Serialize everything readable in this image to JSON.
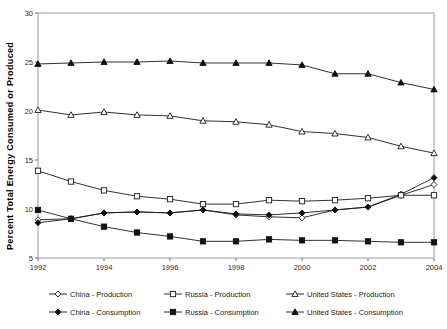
{
  "chart_data": {
    "type": "line",
    "title": "",
    "xlabel": "",
    "ylabel": "Percent Total Energy Consumed or Produced",
    "x": [
      1992,
      1993,
      1994,
      1995,
      1996,
      1997,
      1998,
      1999,
      2000,
      2001,
      2002,
      2003,
      2004
    ],
    "xticks": [
      1992,
      1994,
      1996,
      1998,
      2000,
      2002,
      2004
    ],
    "xtick_labels": [
      "1992",
      "1994",
      "1996",
      "1998",
      "2000",
      "2002",
      "2004"
    ],
    "xlim": [
      1992,
      2004
    ],
    "yticks": [
      5,
      10,
      15,
      20,
      25,
      30
    ],
    "ytick_labels": [
      "5",
      "10",
      "15",
      "20",
      "25",
      "30"
    ],
    "ylim": [
      5,
      30
    ],
    "grid": false,
    "legend_position": "bottom",
    "series": [
      {
        "name": "China - Production",
        "marker": "diamond-open",
        "values": [
          8.9,
          9.0,
          9.6,
          9.7,
          9.6,
          9.9,
          9.4,
          9.2,
          9.1,
          9.9,
          10.2,
          11.4,
          12.5
        ]
      },
      {
        "name": "China - Consumption",
        "marker": "diamond-filled",
        "values": [
          8.6,
          9.0,
          9.6,
          9.7,
          9.6,
          9.9,
          9.5,
          9.4,
          9.6,
          9.9,
          10.2,
          11.5,
          13.2
        ]
      },
      {
        "name": "Russia - Production",
        "marker": "square-open",
        "values": [
          13.9,
          12.8,
          11.9,
          11.3,
          11.0,
          10.5,
          10.5,
          10.9,
          10.8,
          10.9,
          11.1,
          11.4,
          11.4
        ]
      },
      {
        "name": "Russia - Consumption",
        "marker": "square-filled",
        "values": [
          9.9,
          9.0,
          8.2,
          7.6,
          7.2,
          6.7,
          6.7,
          6.9,
          6.8,
          6.8,
          6.7,
          6.6,
          6.6
        ]
      },
      {
        "name": "United States - Production",
        "marker": "triangle-open",
        "values": [
          20.1,
          19.6,
          19.9,
          19.6,
          19.5,
          19.0,
          18.9,
          18.6,
          17.9,
          17.7,
          17.3,
          16.4,
          15.7
        ]
      },
      {
        "name": "United States - Consumption",
        "marker": "triangle-filled",
        "values": [
          24.8,
          24.9,
          25.0,
          25.0,
          25.1,
          24.9,
          24.9,
          24.9,
          24.7,
          23.8,
          23.8,
          22.9,
          22.2
        ]
      }
    ],
    "legend": [
      {
        "label": "China - Production",
        "marker": "diamond-open"
      },
      {
        "label": "Russia - Production",
        "marker": "square-open"
      },
      {
        "label": "United States - Production",
        "marker": "triangle-open"
      },
      {
        "label": "China - Consumption",
        "marker": "diamond-filled"
      },
      {
        "label": "Russia - Consumption",
        "marker": "square-filled"
      },
      {
        "label": "United States - Consumption",
        "marker": "triangle-filled"
      }
    ],
    "colors": {
      "line": "#1a1a1a",
      "axis": "#9a9a9a",
      "text": "#1a1a1a",
      "background": "#ffffff"
    }
  }
}
